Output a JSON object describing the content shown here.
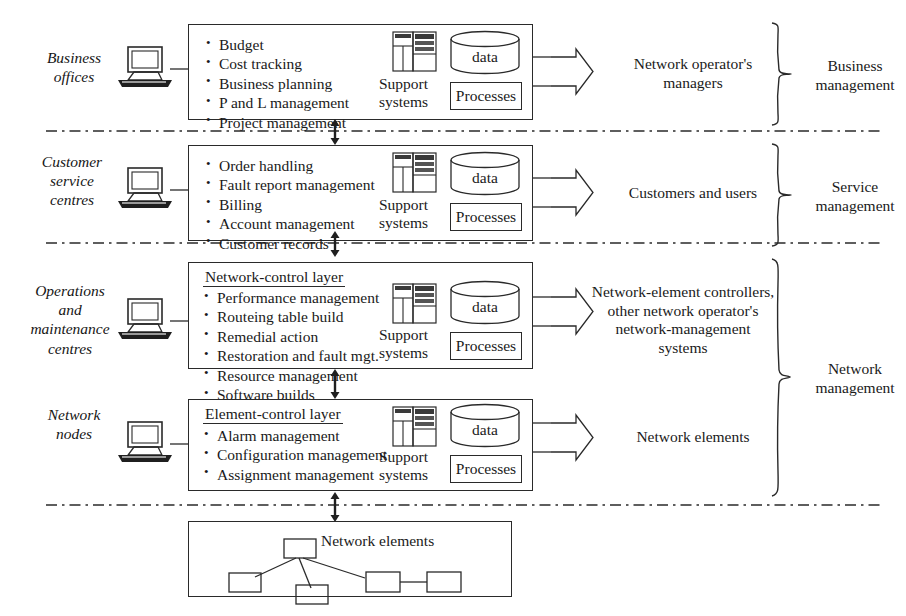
{
  "diagram": {
    "accent": "#2a2a2a",
    "background": "#ffffff"
  },
  "rows": [
    {
      "id": "business",
      "role_label": "Business\noffices",
      "layer_title": "",
      "bullets": [
        "Budget",
        "Cost tracking",
        "Business planning",
        "P and L management",
        "Project management"
      ],
      "support_caption": "Support\nsystems",
      "data_label": "data",
      "processes_label": "Processes",
      "output_label": "Network operator's\nmanagers"
    },
    {
      "id": "service",
      "role_label": "Customer\nservice\ncentres",
      "layer_title": "",
      "bullets": [
        "Order handling",
        "Fault report management",
        "Billing",
        "Account management",
        "Customer records"
      ],
      "support_caption": "Support\nsystems",
      "data_label": "data",
      "processes_label": "Processes",
      "output_label": "Customers and users"
    },
    {
      "id": "network-control",
      "role_label": "Operations\nand\nmaintenance\ncentres",
      "layer_title": "Network-control layer",
      "bullets": [
        "Performance management",
        "Routeing table build",
        "Remedial action",
        "Restoration and fault  mgt.",
        "Resource management",
        "Software builds"
      ],
      "support_caption": "Support\nsystems",
      "data_label": "data",
      "processes_label": "Processes",
      "output_label": "Network-element controllers,\nother network operator's\nnetwork-management\nsystems"
    },
    {
      "id": "element-control",
      "role_label": "Network\nnodes",
      "layer_title": "Element-control layer",
      "bullets": [
        "Alarm management",
        "Configuration  management",
        "Assignment  management"
      ],
      "support_caption": "Support\nsystems",
      "data_label": "data",
      "processes_label": "Processes",
      "output_label": "Network elements"
    }
  ],
  "braces": [
    {
      "id": "business-management",
      "label": "Business\nmanagement"
    },
    {
      "id": "service-management",
      "label": "Service\nmanagement"
    },
    {
      "id": "network-management",
      "label": "Network\nmanagement"
    }
  ],
  "bottom": {
    "id": "network-elements",
    "caption": "Network elements",
    "node_count": 6
  },
  "icons": {
    "terminal": "computer-terminal-icon",
    "server": "server-rack-icon",
    "cylinder": "database-cylinder-icon",
    "arrow_right": "block-arrow-right-icon",
    "arrow_vertical": "double-headed-arrow-icon",
    "brace": "curly-brace-icon"
  }
}
